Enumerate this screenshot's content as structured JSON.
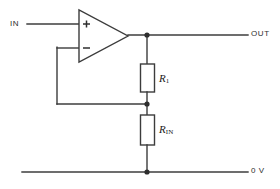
{
  "diagram": {
    "type": "schematic",
    "colors": {
      "wire": "#3c3c3c",
      "node": "#2e2e2e",
      "background": "#ffffff",
      "text": "#2e2e2e"
    },
    "terminals": {
      "input_label": "IN",
      "output_label": "OUT",
      "ground_label": "0 V"
    },
    "opamp": {
      "name": "operational-amplifier",
      "noninverting_input_symbol": "+",
      "inverting_input_symbol": "−"
    },
    "components": [
      {
        "name": "resistor-r1",
        "label_main": "R",
        "label_sub": "1",
        "orientation": "vertical",
        "between": [
          "OUT",
          "feedback-node"
        ]
      },
      {
        "name": "resistor-rin",
        "label_main": "R",
        "label_sub": "IN",
        "orientation": "vertical",
        "between": [
          "feedback-node",
          "0 V"
        ]
      }
    ],
    "nodes": [
      {
        "name": "output-node",
        "x": 147,
        "y": 34
      },
      {
        "name": "feedback-node",
        "x": 147,
        "y": 104
      },
      {
        "name": "ground-node",
        "x": 147,
        "y": 172
      }
    ]
  }
}
